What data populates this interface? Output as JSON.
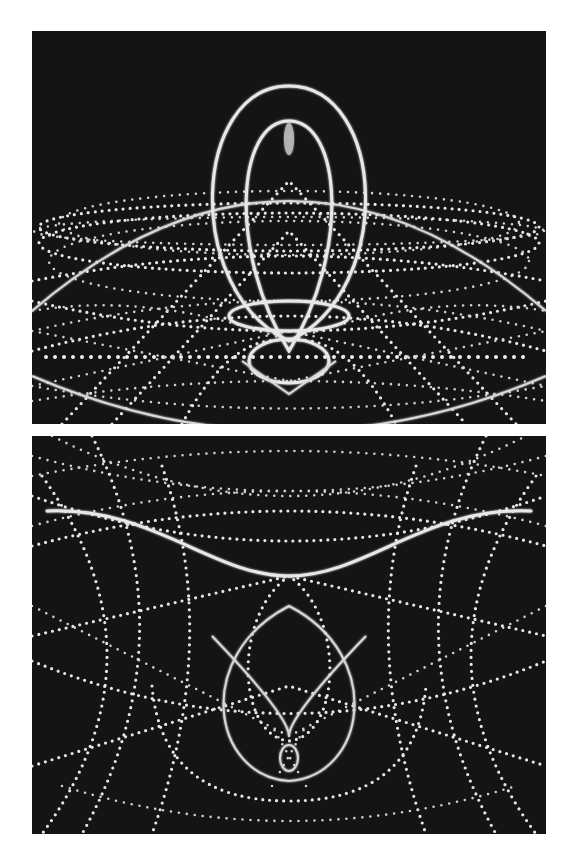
{
  "figure": {
    "panels": [
      {
        "id": "top",
        "description": "Glowing teardrop loop above a dotted disc of orbiting trajectories on black background"
      },
      {
        "id": "bottom",
        "description": "Solid wavy horizontal curve above crossing dotted arcs surrounding a central teardrop loop on black background"
      }
    ],
    "colors": {
      "background": "#ffffff",
      "panel": "#141414",
      "trace": "#e8e8e8"
    }
  }
}
